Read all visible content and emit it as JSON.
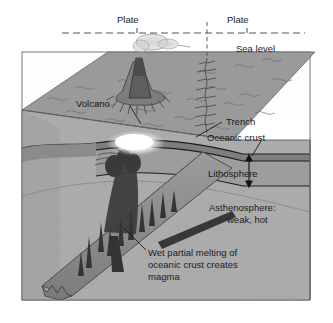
{
  "figure": {
    "background_color": "#ffffff",
    "frame_color": "#8d8d8d"
  },
  "labels": {
    "plate_left": "Plate",
    "plate_right": "Plate",
    "sea_level": "Sea level",
    "volcano": "Volcano",
    "trench": "Trench",
    "oceanic_crust": "Oceanic crust",
    "lithosphere": "Lithosphere",
    "asthenosphere_line1": "Asthenosphere:",
    "asthenosphere_line2": "weak, hot",
    "melting_line1": "Wet partial melting of",
    "melting_line2": "oceanic crust creates",
    "melting_line3": "magma"
  },
  "colors": {
    "ocean_surface": "#9a9a9a",
    "ocean_surface_dark": "#8e8e8e",
    "front_face_upper": "#a3a3a3",
    "asthenosphere": "#aaaaaa",
    "lithosphere_band": "#959595",
    "crust_band": "#8a8a8a",
    "slab": "#8f8f8f",
    "slab_shadow": "#6f6f6f",
    "volcano_cone": "#6a6a6a",
    "volcano_flank": "#7c7c7c",
    "magma_white": "#ffffff",
    "plume_smoke": "#bdbdbd",
    "line_dark": "#222222",
    "dashed": "#555555"
  }
}
